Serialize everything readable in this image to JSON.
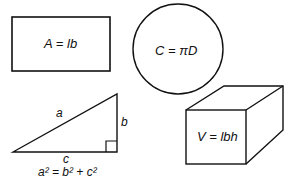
{
  "rectangle": {
    "formula": "A = lb"
  },
  "circle": {
    "formula": "C = πD"
  },
  "triangle": {
    "side_a": "a",
    "side_b": "b",
    "side_c": "c",
    "formula": "a² = b² + c²"
  },
  "box": {
    "formula": "V = lbh"
  },
  "colors": {
    "stroke": "#111111",
    "background": "#ffffff"
  }
}
